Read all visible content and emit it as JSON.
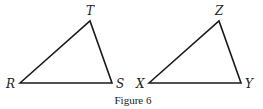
{
  "figure": {
    "caption": "Figure 6",
    "stroke_color": "#1a1a1a",
    "triangles": [
      {
        "name": "RST",
        "vertices": [
          {
            "label": "R",
            "x": 20,
            "y": 83,
            "lx": 6,
            "ly": 88
          },
          {
            "label": "T",
            "x": 90,
            "y": 21,
            "lx": 86,
            "ly": 15
          },
          {
            "label": "S",
            "x": 112,
            "y": 83,
            "lx": 116,
            "ly": 88
          }
        ]
      },
      {
        "name": "XYZ",
        "vertices": [
          {
            "label": "X",
            "x": 149,
            "y": 83,
            "lx": 136,
            "ly": 88
          },
          {
            "label": "Z",
            "x": 219,
            "y": 21,
            "lx": 215,
            "ly": 15
          },
          {
            "label": "Y",
            "x": 241,
            "y": 83,
            "lx": 245,
            "ly": 88
          }
        ]
      }
    ]
  }
}
